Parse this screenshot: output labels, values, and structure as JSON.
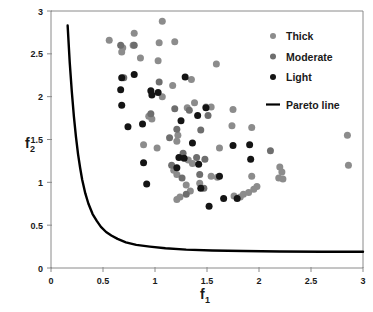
{
  "chart_data": {
    "type": "scatter",
    "title": "",
    "xlabel": "f_1",
    "ylabel": "f_2",
    "xlabel_base": "f",
    "xlabel_sub": "1",
    "ylabel_base": "f",
    "ylabel_sub": "2",
    "xlim": [
      0,
      3
    ],
    "ylim": [
      0,
      3
    ],
    "xticks": [
      0,
      0.5,
      1,
      1.5,
      2,
      2.5,
      3
    ],
    "xticklabels": [
      "0",
      "0.5",
      "1",
      "1.5",
      "2",
      "2.5",
      "3"
    ],
    "yticks": [
      0,
      0.5,
      1,
      1.5,
      2,
      2.5,
      3
    ],
    "yticklabels": [
      "0",
      "0.5",
      "1",
      "1.5",
      "2",
      "2.5",
      "3"
    ],
    "grid": false,
    "legend_position": "top-right",
    "marker_size": 7,
    "legend": [
      {
        "label": "Thick",
        "marker": "circle",
        "color": "#8c8c8c",
        "type": "marker"
      },
      {
        "label": "Moderate",
        "marker": "circle",
        "color": "#6e6e6e",
        "type": "marker"
      },
      {
        "label": "Light",
        "marker": "circle",
        "color": "#141414",
        "type": "marker"
      },
      {
        "label": "Pareto line",
        "marker": "line",
        "color": "#000000",
        "type": "line"
      }
    ],
    "series": [
      {
        "name": "Thick",
        "color": "#8c8c8c",
        "points": [
          [
            0.56,
            2.66
          ],
          [
            0.69,
            2.57
          ],
          [
            0.68,
            2.52
          ],
          [
            0.8,
            2.74
          ],
          [
            0.79,
            2.6
          ],
          [
            0.86,
            2.45
          ],
          [
            1.07,
            2.88
          ],
          [
            1.04,
            2.63
          ],
          [
            1.03,
            2.42
          ],
          [
            1.19,
            2.64
          ],
          [
            1.59,
            2.38
          ],
          [
            1.17,
            2.13
          ],
          [
            1.07,
            2.0
          ],
          [
            1.31,
            1.87
          ],
          [
            1.38,
            1.93
          ],
          [
            1.49,
            1.88
          ],
          [
            1.54,
            1.88
          ],
          [
            1.75,
            1.85
          ],
          [
            1.35,
            2.2
          ],
          [
            1.93,
            1.64
          ],
          [
            1.74,
            1.66
          ],
          [
            1.22,
            1.55
          ],
          [
            2.85,
            1.55
          ],
          [
            2.86,
            1.2
          ],
          [
            0.94,
            1.77
          ],
          [
            0.97,
            1.74
          ],
          [
            0.89,
            1.44
          ],
          [
            1.02,
            1.4
          ],
          [
            1.21,
            1.48
          ],
          [
            1.32,
            1.26
          ],
          [
            1.36,
            1.22
          ],
          [
            1.62,
            1.4
          ],
          [
            1.93,
            1.07
          ],
          [
            1.98,
            0.95
          ],
          [
            1.95,
            0.92
          ],
          [
            2.19,
            1.05
          ],
          [
            2.23,
            1.04
          ],
          [
            2.22,
            1.12
          ],
          [
            2.2,
            1.18
          ],
          [
            1.21,
            1.09
          ],
          [
            1.18,
            1.14
          ],
          [
            1.3,
            0.97
          ],
          [
            1.43,
            0.99
          ],
          [
            1.54,
            1.07
          ],
          [
            1.6,
            1.06
          ],
          [
            1.24,
            0.83
          ],
          [
            1.21,
            0.8
          ],
          [
            1.34,
            0.9
          ],
          [
            1.76,
            0.84
          ],
          [
            1.82,
            0.83
          ],
          [
            1.85,
            0.86
          ],
          [
            1.9,
            0.88
          ]
        ]
      },
      {
        "name": "Moderate",
        "color": "#6e6e6e",
        "points": [
          [
            0.67,
            2.6
          ],
          [
            0.8,
            2.6
          ],
          [
            1.04,
            2.17
          ],
          [
            1.19,
            1.86
          ],
          [
            1.33,
            1.84
          ],
          [
            0.96,
            1.8
          ],
          [
            1.21,
            1.62
          ],
          [
            1.14,
            1.52
          ],
          [
            1.44,
            1.61
          ],
          [
            1.51,
            1.78
          ],
          [
            1.27,
            1.34
          ],
          [
            1.4,
            1.29
          ],
          [
            1.48,
            1.27
          ],
          [
            1.16,
            1.2
          ],
          [
            1.26,
            1.05
          ],
          [
            1.43,
            1.09
          ],
          [
            1.3,
            0.86
          ],
          [
            1.47,
            0.93
          ],
          [
            0.7,
            2.22
          ],
          [
            2.11,
            1.37
          ]
        ]
      },
      {
        "name": "Light",
        "color": "#141414",
        "points": [
          [
            0.68,
            2.22
          ],
          [
            0.8,
            2.26
          ],
          [
            0.67,
            2.08
          ],
          [
            0.68,
            1.9
          ],
          [
            0.96,
            2.07
          ],
          [
            0.97,
            2.02
          ],
          [
            1.03,
            2.05
          ],
          [
            1.29,
            2.23
          ],
          [
            0.74,
            1.65
          ],
          [
            0.88,
            1.68
          ],
          [
            1.25,
            1.72
          ],
          [
            1.41,
            1.78
          ],
          [
            1.49,
            1.87
          ],
          [
            1.36,
            1.46
          ],
          [
            1.75,
            1.43
          ],
          [
            1.92,
            1.27
          ],
          [
            0.89,
            1.23
          ],
          [
            1.21,
            1.17
          ],
          [
            1.23,
            1.29
          ],
          [
            1.28,
            1.28
          ],
          [
            1.42,
            1.21
          ],
          [
            1.62,
            1.07
          ],
          [
            0.92,
            0.98
          ],
          [
            1.44,
            0.93
          ],
          [
            1.52,
            0.72
          ],
          [
            1.66,
            0.81
          ],
          [
            1.79,
            0.81
          ],
          [
            1.91,
            1.44
          ]
        ]
      }
    ],
    "pareto_line": {
      "name": "Pareto line",
      "color": "#000000",
      "points": [
        [
          0.16,
          2.83
        ],
        [
          0.18,
          2.4
        ],
        [
          0.2,
          2.06
        ],
        [
          0.22,
          1.77
        ],
        [
          0.24,
          1.53
        ],
        [
          0.26,
          1.33
        ],
        [
          0.28,
          1.17
        ],
        [
          0.3,
          1.03
        ],
        [
          0.33,
          0.87
        ],
        [
          0.36,
          0.75
        ],
        [
          0.4,
          0.63
        ],
        [
          0.44,
          0.55
        ],
        [
          0.48,
          0.48
        ],
        [
          0.53,
          0.42
        ],
        [
          0.58,
          0.38
        ],
        [
          0.64,
          0.34
        ],
        [
          0.72,
          0.3
        ],
        [
          0.82,
          0.27
        ],
        [
          0.95,
          0.25
        ],
        [
          1.1,
          0.23
        ],
        [
          1.3,
          0.215
        ],
        [
          1.55,
          0.205
        ],
        [
          1.85,
          0.198
        ],
        [
          2.2,
          0.193
        ],
        [
          2.6,
          0.19
        ],
        [
          3.0,
          0.189
        ]
      ]
    }
  }
}
